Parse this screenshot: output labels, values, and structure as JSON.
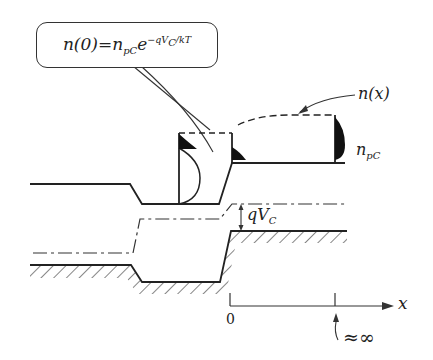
{
  "diagram": {
    "type": "energy band diagram with carrier concentration profile",
    "equation_callout": {
      "lhs": "n(0)",
      "equals": "=",
      "rhs_base": "n",
      "rhs_sub": "pC",
      "rhs_exp_base": "e",
      "rhs_exponent": "−qV",
      "rhs_exponent_sub": "C",
      "rhs_exponent_tail": "/kT"
    },
    "labels": {
      "n_x": "n(x)",
      "n_pc_base": "n",
      "n_pc_sub": "pC",
      "qvc_base": "qV",
      "qvc_sub": "C",
      "axis_x": "x",
      "axis_origin": "0",
      "infinity_marker": "≈∞"
    },
    "colors": {
      "line": "#222222",
      "fill": "#111111",
      "background": "#ffffff"
    }
  }
}
